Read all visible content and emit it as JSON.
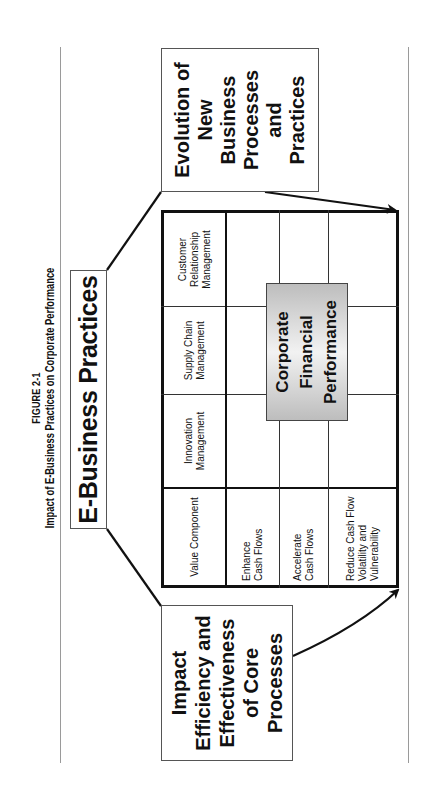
{
  "figure": {
    "number": "FIGURE 2-1",
    "title": "Impact of E-Business Practices on Corporate Performance"
  },
  "diagram": {
    "top_box": "E-Business Practices",
    "left_box": [
      "Impact",
      "Efficiency and",
      "Effectiveness",
      "of Core",
      "Processes"
    ],
    "right_box": [
      "Evolution of",
      "New",
      "Business",
      "Processes",
      "and",
      "Practices"
    ],
    "center_box": [
      "Corporate",
      "Financial",
      "Performance"
    ],
    "table": {
      "header": [
        "Value Component",
        "Innovation Management",
        "Supply Chain Management",
        "Customer Relationship Management"
      ],
      "rows": [
        "Enhance Cash Flows",
        "Accelerate Cash Flows",
        "Reduce Cash Flow Volatility and Vulnerability"
      ]
    }
  },
  "colors": {
    "line": "#111111",
    "center_box_gradient_edge": "#bdbdbd",
    "center_box_gradient_mid": "#f2f2f2",
    "rule": "#9a9a9a"
  }
}
